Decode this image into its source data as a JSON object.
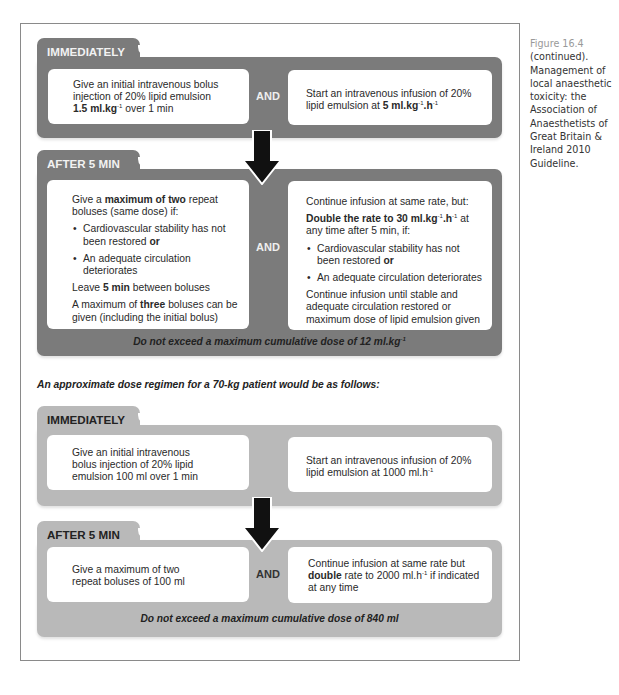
{
  "caption": {
    "figure_label": "Figure 16.4",
    "text": "(continued). Management of local anaesthetic toxicity: the Association of Anaesthetists of Great Britain & Ireland 2010 Guideline."
  },
  "section1": {
    "immediately": {
      "title": "IMMEDIATELY",
      "left": {
        "line1": "Give an initial intravenous bolus",
        "line2": "injection of 20% lipid emulsion",
        "dose": "1.5 ml.kg",
        "dose_sup": "-1",
        "after_dose": " over 1 min"
      },
      "and": "AND",
      "right": {
        "line1": "Start an intravenous infusion of 20%",
        "line2_prefix": "lipid emulsion at  ",
        "dose_a": "5 ml.kg",
        "dose_a_sup": "-1",
        "dose_b": ".h",
        "dose_b_sup": "-1"
      }
    },
    "after5": {
      "title": "AFTER 5 MIN",
      "left": {
        "p1_pre": "Give a ",
        "p1_bold": "maximum of two",
        "p1_post": " repeat boluses (same dose) if:",
        "bullet1_pre": "Cardiovascular stability has not been restored ",
        "bullet1_bold": "or",
        "bullet2": "An adequate circulation deteriorates",
        "p2_pre": "Leave ",
        "p2_bold": "5 min",
        "p2_post": " between boluses",
        "p3_pre": "A maximum of ",
        "p3_bold": "three",
        "p3_post": " boluses can be given (including the initial bolus)"
      },
      "and": "AND",
      "right": {
        "p1": "Continue infusion at same rate, but:",
        "p2_bold_a": "Double the rate to 30 ml.kg",
        "p2_sup_a": "-1",
        "p2_bold_b": ".h",
        "p2_sup_b": "-1",
        "p2_post": " at any time after 5 min, if:",
        "bullet1_pre": "Cardiovascular stability has not been restored ",
        "bullet1_bold": "or",
        "bullet2": "An adequate circulation deteriorates",
        "p3": "Continue infusion until stable and adequate circulation restored or maximum dose of lipid emulsion given"
      },
      "note": "Do not exceed a maximum cumulative dose of 12 ml.kg",
      "note_sup": "-1"
    }
  },
  "intro_70kg": "An approximate dose regimen for a 70-kg patient would be as follows:",
  "section2": {
    "immediately": {
      "title": "IMMEDIATELY",
      "left": "Give an initial intravenous bolus injection of 20% lipid emulsion 100 ml over 1 min",
      "right_pre": "Start an intravenous infusion of 20% lipid emulsion at 1000 ml.h",
      "right_sup": "-1"
    },
    "after5": {
      "title": "AFTER 5 MIN",
      "left": "Give a maximum of two repeat boluses of 100 ml",
      "and": "AND",
      "right_pre": "Continue infusion at same rate but ",
      "right_bold": "double",
      "right_mid": " rate to 2000 ml.h",
      "right_sup": "-1",
      "right_post": " if indicated at any time",
      "note": "Do not exceed a maximum cumulative dose of 840 ml"
    }
  },
  "colors": {
    "dark_panel": "#7b7b7b",
    "light_panel": "#b9b9b9",
    "arrow": "#111111"
  }
}
